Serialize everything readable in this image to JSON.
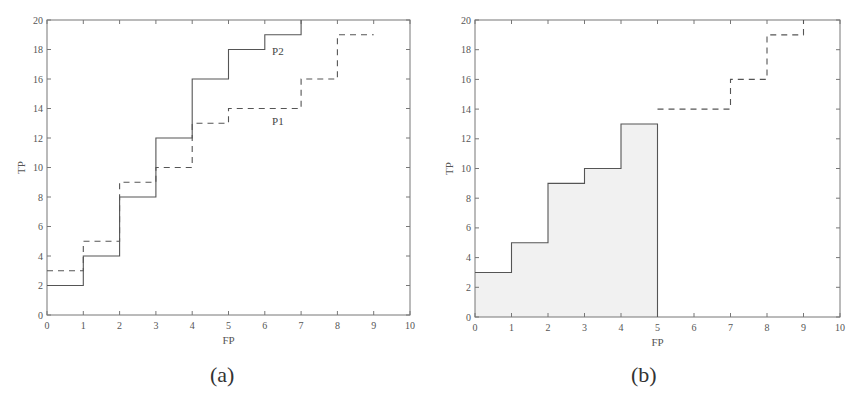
{
  "chart_data": [
    {
      "id": "a",
      "type": "line",
      "step": true,
      "caption": "(a)",
      "xlabel": "FP",
      "ylabel": "TP",
      "xlim": [
        0,
        10
      ],
      "ylim": [
        0,
        20
      ],
      "xticks": [
        0,
        1,
        2,
        3,
        4,
        5,
        6,
        7,
        8,
        9,
        10
      ],
      "yticks": [
        0,
        2,
        4,
        6,
        8,
        10,
        12,
        14,
        16,
        18,
        20
      ],
      "grid": false,
      "series": [
        {
          "name": "P2",
          "style": "solid",
          "points": [
            [
              0,
              2
            ],
            [
              1,
              2
            ],
            [
              1,
              4
            ],
            [
              2,
              4
            ],
            [
              2,
              8
            ],
            [
              3,
              8
            ],
            [
              3,
              12
            ],
            [
              4,
              12
            ],
            [
              4,
              16
            ],
            [
              5,
              16
            ],
            [
              5,
              18
            ],
            [
              6,
              18
            ],
            [
              6,
              19
            ],
            [
              7,
              19
            ],
            [
              7,
              20
            ]
          ],
          "label_pos": [
            6.2,
            17.6
          ]
        },
        {
          "name": "P1",
          "style": "dashed",
          "points": [
            [
              0,
              3
            ],
            [
              1,
              3
            ],
            [
              1,
              5
            ],
            [
              2,
              5
            ],
            [
              2,
              9
            ],
            [
              3,
              9
            ],
            [
              3,
              10
            ],
            [
              4,
              10
            ],
            [
              4,
              13
            ],
            [
              5,
              13
            ],
            [
              5,
              14
            ],
            [
              7,
              14
            ],
            [
              7,
              16
            ],
            [
              8,
              16
            ],
            [
              8,
              19
            ],
            [
              9,
              19
            ]
          ],
          "label_pos": [
            6.2,
            12.9
          ]
        }
      ]
    },
    {
      "id": "b",
      "type": "area",
      "step": true,
      "caption": "(b)",
      "xlabel": "FP",
      "ylabel": "TP",
      "xlim": [
        0,
        10
      ],
      "ylim": [
        0,
        20
      ],
      "xticks": [
        0,
        1,
        2,
        3,
        4,
        5,
        6,
        7,
        8,
        9,
        10
      ],
      "yticks": [
        0,
        2,
        4,
        6,
        8,
        10,
        12,
        14,
        16,
        18,
        20
      ],
      "grid": false,
      "series": [
        {
          "name": "solid-shaded",
          "style": "solid",
          "filled": true,
          "points": [
            [
              0,
              3
            ],
            [
              1,
              3
            ],
            [
              1,
              5
            ],
            [
              2,
              5
            ],
            [
              2,
              9
            ],
            [
              3,
              9
            ],
            [
              3,
              10
            ],
            [
              4,
              10
            ],
            [
              4,
              13
            ],
            [
              5,
              13
            ],
            [
              5,
              0
            ]
          ]
        },
        {
          "name": "dashed",
          "style": "dashed",
          "points": [
            [
              5,
              14
            ],
            [
              7,
              14
            ],
            [
              7,
              16
            ],
            [
              8,
              16
            ],
            [
              8,
              19
            ],
            [
              9,
              19
            ],
            [
              9,
              20
            ]
          ]
        }
      ]
    }
  ]
}
